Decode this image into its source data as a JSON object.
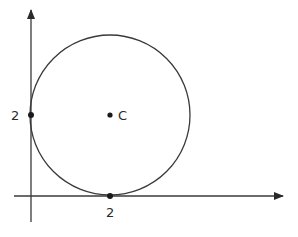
{
  "diagram": {
    "type": "circle-tangent-to-axes",
    "colors": {
      "stroke": "#3a3a3a",
      "point": "#1a1a1a",
      "text": "#2a2a2a",
      "background": "#ffffff"
    },
    "axes": {
      "x_axis": {
        "arrow": true
      },
      "y_axis": {
        "arrow": true
      }
    },
    "circle": {
      "center_label": "C",
      "radius_value": 2
    },
    "points": [
      {
        "name": "y-intercept-tangent",
        "label": "2"
      },
      {
        "name": "x-intercept-tangent",
        "label": "2"
      },
      {
        "name": "center",
        "label": "C"
      }
    ],
    "labels": {
      "y_tick": "2",
      "x_tick": "2",
      "center": "C"
    }
  }
}
